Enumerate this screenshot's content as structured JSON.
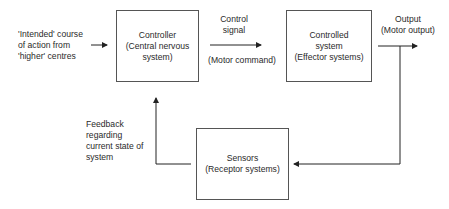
{
  "input": {
    "lines": [
      "'Intended' course",
      "of action from",
      "'higher' centres"
    ]
  },
  "controller": {
    "title": "Controller",
    "subtitle_lines": [
      "(Central nervous",
      "system)"
    ]
  },
  "control_signal": {
    "lines": [
      "Control",
      "signal"
    ],
    "below": "(Motor command)"
  },
  "controlled_system": {
    "title_lines": [
      "Controlled",
      "system"
    ],
    "subtitle": "(Effector systems)"
  },
  "output": {
    "lines": [
      "Output",
      "(Motor output)"
    ]
  },
  "sensors": {
    "title": "Sensors",
    "subtitle": "(Receptor systems)"
  },
  "feedback": {
    "lines": [
      "Feedback",
      "regarding",
      "current state of",
      "system"
    ]
  },
  "colors": {
    "line": "#222222",
    "box_border": "#555555",
    "text": "#2a2a2a"
  }
}
